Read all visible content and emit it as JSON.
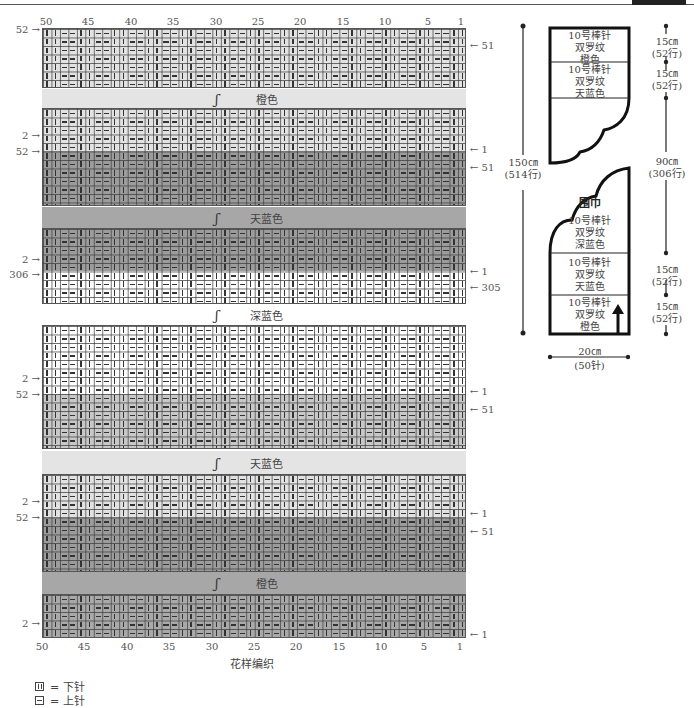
{
  "chart_title": "花样编织",
  "column_numbers": [
    "50",
    "45",
    "40",
    "35",
    "30",
    "25",
    "20",
    "15",
    "10",
    "5",
    "1"
  ],
  "bands": [
    {
      "id": "band-orange-top",
      "label": "橙色",
      "swirl": "ʃ",
      "color": "#e4e4e4"
    },
    {
      "id": "band-skyblue-top",
      "label": "天蓝色",
      "swirl": "ʃ",
      "color": "#a7a7a7"
    },
    {
      "id": "band-navy",
      "label": "深蓝色",
      "swirl": "ʃ",
      "color": "#ffffff"
    },
    {
      "id": "band-skyblue-bottom",
      "label": "天蓝色",
      "swirl": "ʃ",
      "color": "#e4e4e4"
    },
    {
      "id": "band-orange-bottom",
      "label": "橙色",
      "swirl": "ʃ",
      "color": "#a7a7a7"
    }
  ],
  "shades": {
    "white": "#ffffff",
    "light": "#e2e2e2",
    "mid": "#c8c8c8",
    "dark": "#9c9c9c"
  },
  "row_labels": {
    "block1_left": "52",
    "block1_right": "51",
    "block2_left_a": "2",
    "block2_left_b": "52",
    "block2_right_a": "1",
    "block2_right_b": "51",
    "block3_left_a": "2",
    "block3_left_b": "306",
    "block3_right_a": "1",
    "block3_right_b": "305",
    "block4_left_a": "2",
    "block4_left_b": "52",
    "block4_right_a": "1",
    "block4_right_b": "51",
    "block5_left_a": "2",
    "block5_left_b": "52",
    "block5_right_a": "1",
    "block5_right_b": "51",
    "block6_left": "2",
    "block6_right": "1"
  },
  "arrows": {
    "left": "→",
    "right": "←"
  },
  "legend": [
    {
      "symbol": "knit",
      "text": "= 下针"
    },
    {
      "symbol": "purl",
      "text": "= 上针"
    }
  ],
  "schematic": {
    "title": "围巾",
    "top_piece": [
      {
        "line1": "10号棒针",
        "line2": "双罗纹",
        "line3": "橙色"
      },
      {
        "line1": "10号棒针",
        "line2": "双罗纹",
        "line3": "天蓝色"
      }
    ],
    "bottom_piece": [
      {
        "line1": "10号棒针",
        "line2": "双罗纹",
        "line3": "深蓝色"
      },
      {
        "line1": "10号棒针",
        "line2": "双罗纹",
        "line3": "天蓝色"
      },
      {
        "line1": "10号棒针",
        "line2": "双罗纹",
        "line3": "橙色"
      }
    ],
    "total_length": {
      "cm": "150㎝",
      "rows": "(514行)"
    },
    "dims_right": [
      {
        "cm": "15㎝",
        "rows": "(52行)"
      },
      {
        "cm": "15㎝",
        "rows": "(52行)"
      },
      {
        "cm": "90㎝",
        "rows": "(306行)"
      },
      {
        "cm": "15㎝",
        "rows": "(52行)"
      },
      {
        "cm": "15㎝",
        "rows": "(52行)"
      }
    ],
    "width": {
      "cm": "20㎝",
      "stitches": "(50针)"
    }
  }
}
